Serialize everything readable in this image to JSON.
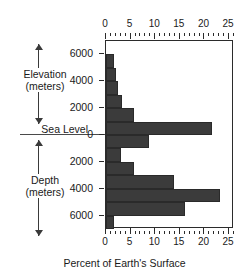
{
  "figure": {
    "left_axis": {
      "upper_label_line1": "Elevation",
      "upper_label_line2": "(meters)",
      "sea_level_label": "Sea Level",
      "lower_label_line1": "Depth",
      "lower_label_line2": "(meters)"
    },
    "bottom_axis_title": "Percent of Earth's Surface",
    "y_tick_labels": [
      "6000",
      "4000",
      "2000",
      "0",
      "2000",
      "4000",
      "6000"
    ],
    "x_tick_labels": [
      "0",
      "5",
      "10",
      "15",
      "20",
      "25"
    ]
  },
  "chart_data": {
    "type": "bar",
    "orientation": "horizontal",
    "title": "",
    "xlabel": "Percent of Earth's Surface",
    "ylabel": "Elevation / Depth (meters)",
    "xlim": [
      0,
      26
    ],
    "ylim": [
      -7000,
      7000
    ],
    "grid": false,
    "legend": null,
    "bar_color": "#3b3b3b",
    "sea_level": 0,
    "x_ticks": [
      0,
      5,
      10,
      15,
      20,
      25
    ],
    "x_minor_tick_step": 1,
    "y_ticks": [
      6000,
      4000,
      2000,
      0,
      -2000,
      -4000,
      -6000
    ],
    "y_tick_labels": [
      "6000",
      "4000",
      "2000",
      "0",
      "2000",
      "4000",
      "6000"
    ],
    "categories": [
      "5000 to 6000 m elevation",
      "4000 to 5000 m elevation",
      "3000 to 4000 m elevation",
      "2000 to 3000 m elevation",
      "1000 to 2000 m elevation",
      "0 to 1000 m elevation",
      "0 to 1000 m depth",
      "1000 to 2000 m depth",
      "2000 to 3000 m depth",
      "3000 to 4000 m depth",
      "4000 to 5000 m depth",
      "5000 to 6000 m depth",
      "6000 to 7000 m depth"
    ],
    "bin_top_m": [
      6000,
      5000,
      4000,
      3000,
      2000,
      1000,
      0,
      -1000,
      -2000,
      -3000,
      -4000,
      -5000,
      -6000
    ],
    "bin_bottom_m": [
      5000,
      4000,
      3000,
      2000,
      1000,
      0,
      -1000,
      -2000,
      -3000,
      -4000,
      -5000,
      -6000,
      -7000
    ],
    "values": [
      1.6,
      2.0,
      2.5,
      3.3,
      5.6,
      21.5,
      8.7,
      3.0,
      5.7,
      13.9,
      23.2,
      16.0,
      1.7
    ],
    "units": "percent"
  }
}
